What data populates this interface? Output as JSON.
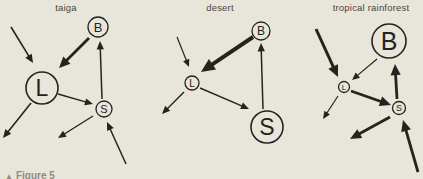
{
  "colors": {
    "background": "#e8e5da",
    "ink": "#242320",
    "title_text": "#4a453b",
    "caption_text": "#8f8c82"
  },
  "caption": {
    "marker": "▲",
    "text": "Figure 5"
  },
  "panels": [
    {
      "title": "taiga",
      "nodes": [
        {
          "id": "B",
          "label": "B",
          "x": 98,
          "y": 27,
          "r": 10,
          "font": 13
        },
        {
          "id": "L",
          "label": "L",
          "x": 42,
          "y": 88,
          "r": 16,
          "font": 23
        },
        {
          "id": "S",
          "label": "S",
          "x": 104,
          "y": 109,
          "r": 8,
          "font": 11
        }
      ],
      "arrows": [
        {
          "name": "in-to-L",
          "x1": 11,
          "y1": 27,
          "x2": 33,
          "y2": 63,
          "w": 1.6
        },
        {
          "name": "B-to-L",
          "x1": 89,
          "y1": 38,
          "x2": 59,
          "y2": 68,
          "w": 2.8
        },
        {
          "name": "S-to-B",
          "x1": 102,
          "y1": 99,
          "x2": 100,
          "y2": 41,
          "w": 1.5
        },
        {
          "name": "L-to-S",
          "x1": 58,
          "y1": 94,
          "x2": 93,
          "y2": 104,
          "w": 1.4
        },
        {
          "name": "L-out",
          "x1": 31,
          "y1": 103,
          "x2": 3,
          "y2": 138,
          "w": 1.6
        },
        {
          "name": "S-out",
          "x1": 93,
          "y1": 116,
          "x2": 58,
          "y2": 138,
          "w": 1.4
        },
        {
          "name": "in-to-S",
          "x1": 126,
          "y1": 164,
          "x2": 107,
          "y2": 122,
          "w": 1.5
        }
      ]
    },
    {
      "title": "desert",
      "nodes": [
        {
          "id": "B",
          "label": "B",
          "x": 261,
          "y": 31,
          "r": 9,
          "font": 12
        },
        {
          "id": "L",
          "label": "L",
          "x": 192,
          "y": 83,
          "r": 7,
          "font": 10
        },
        {
          "id": "S",
          "label": "S",
          "x": 267,
          "y": 127,
          "r": 16,
          "font": 23
        }
      ],
      "arrows": [
        {
          "name": "in-to-L",
          "x1": 177,
          "y1": 37,
          "x2": 189,
          "y2": 67,
          "w": 1.2
        },
        {
          "name": "B-to-L",
          "x1": 253,
          "y1": 37,
          "x2": 201,
          "y2": 72,
          "w": 4
        },
        {
          "name": "S-to-B",
          "x1": 263,
          "y1": 109,
          "x2": 261,
          "y2": 43,
          "w": 1.5
        },
        {
          "name": "L-to-S",
          "x1": 200,
          "y1": 88,
          "x2": 249,
          "y2": 109,
          "w": 1.4
        },
        {
          "name": "L-out",
          "x1": 184,
          "y1": 92,
          "x2": 162,
          "y2": 114,
          "w": 1.4
        }
      ]
    },
    {
      "title": "tropical rainforest",
      "nodes": [
        {
          "id": "B",
          "label": "B",
          "x": 389,
          "y": 41,
          "r": 17,
          "font": 25
        },
        {
          "id": "L",
          "label": "L",
          "x": 344,
          "y": 87,
          "r": 5.5,
          "font": 8
        },
        {
          "id": "S",
          "label": "S",
          "x": 399,
          "y": 108,
          "r": 6.5,
          "font": 9
        }
      ],
      "arrows": [
        {
          "name": "in-to-L",
          "x1": 316,
          "y1": 29,
          "x2": 338,
          "y2": 77,
          "w": 3
        },
        {
          "name": "B-to-L",
          "x1": 377,
          "y1": 59,
          "x2": 352,
          "y2": 80,
          "w": 1.2
        },
        {
          "name": "L-to-S",
          "x1": 351,
          "y1": 91,
          "x2": 391,
          "y2": 105,
          "w": 2.8
        },
        {
          "name": "S-to-B",
          "x1": 397,
          "y1": 99,
          "x2": 395,
          "y2": 64,
          "w": 2.8
        },
        {
          "name": "L-out",
          "x1": 338,
          "y1": 96,
          "x2": 323,
          "y2": 119,
          "w": 1.2
        },
        {
          "name": "S-out",
          "x1": 390,
          "y1": 117,
          "x2": 350,
          "y2": 139,
          "w": 2.8
        },
        {
          "name": "in-to-S",
          "x1": 418,
          "y1": 172,
          "x2": 403,
          "y2": 120,
          "w": 2.8
        }
      ]
    }
  ]
}
